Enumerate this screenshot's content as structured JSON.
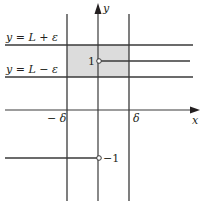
{
  "diagram": {
    "title": "",
    "colors": {
      "line": "#3a3a3a",
      "shade": "#dcdcdc",
      "text": "#231f20",
      "background": "#ffffff"
    },
    "axes": {
      "x_label": "x",
      "y_label": "y"
    },
    "horizontal_lines": [
      {
        "label": "y = L + ε",
        "y_px": 45
      },
      {
        "label": "y = L − ε",
        "y_px": 77
      }
    ],
    "vertical_lines": [
      {
        "label": "− δ",
        "x_px": 67
      },
      {
        "label": "δ",
        "x_px": 129
      }
    ],
    "function_pieces": [
      {
        "value_label": "1",
        "side": "right",
        "y_px": 61,
        "open_endpoint": true
      },
      {
        "value_label": "−1",
        "side": "left",
        "y_px": 158,
        "open_endpoint": true
      }
    ],
    "shaded_region": {
      "x_from": "−δ",
      "x_to": "δ",
      "y_from": "L − ε",
      "y_to": "L + ε"
    }
  }
}
